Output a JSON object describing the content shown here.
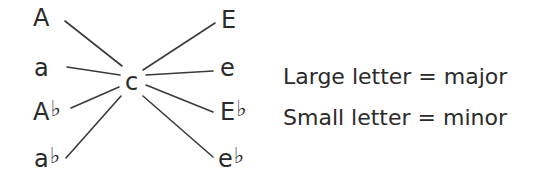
{
  "diagram": {
    "center": {
      "label": "c"
    },
    "left_nodes": [
      {
        "label": "A",
        "flat": ""
      },
      {
        "label": "a",
        "flat": ""
      },
      {
        "label": "A",
        "flat": "♭"
      },
      {
        "label": "a",
        "flat": "♭"
      }
    ],
    "right_nodes": [
      {
        "label": "E",
        "flat": ""
      },
      {
        "label": "e",
        "flat": ""
      },
      {
        "label": "E",
        "flat": "♭"
      },
      {
        "label": "e",
        "flat": "♭"
      }
    ],
    "edges": [
      {
        "from": "c",
        "to": "A"
      },
      {
        "from": "c",
        "to": "a"
      },
      {
        "from": "c",
        "to": "A♭"
      },
      {
        "from": "c",
        "to": "a♭"
      },
      {
        "from": "c",
        "to": "E"
      },
      {
        "from": "c",
        "to": "e"
      },
      {
        "from": "c",
        "to": "E♭"
      },
      {
        "from": "c",
        "to": "e♭"
      }
    ],
    "line_color": "#3a3a3a"
  },
  "legend": {
    "line1": "Large letter = major",
    "line2": "Small letter = minor"
  }
}
